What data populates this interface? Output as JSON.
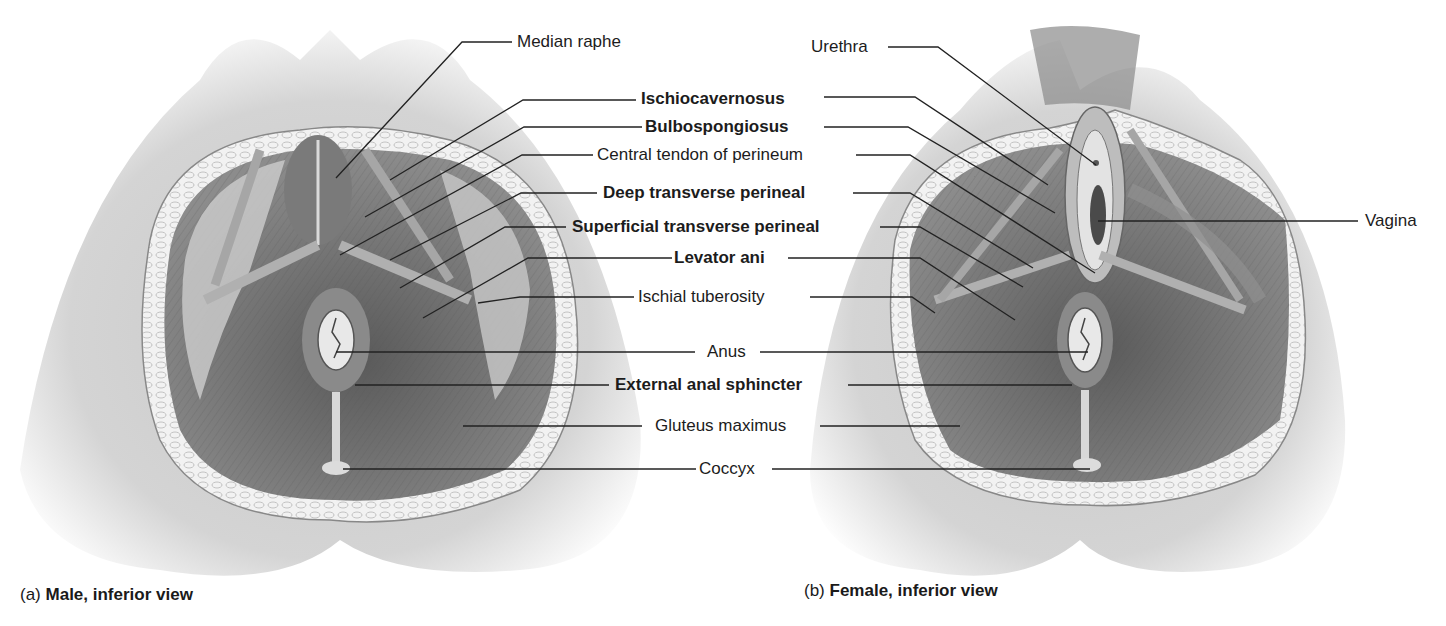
{
  "figure": {
    "panels": [
      {
        "id": "a",
        "caption_letter": "(a)",
        "caption_title": "Male, inferior view"
      },
      {
        "id": "b",
        "caption_letter": "(b)",
        "caption_title": "Female, inferior view"
      }
    ],
    "labels": {
      "median_raphe": "Median raphe",
      "urethra": "Urethra",
      "ischiocavernosus": "Ischiocavernosus",
      "bulbospongiosus": "Bulbospongiosus",
      "central_tendon": "Central tendon of perineum",
      "deep_transverse": "Deep transverse perineal",
      "superficial_transverse": "Superficial transverse perineal",
      "levator_ani": "Levator ani",
      "ischial_tuberosity": "Ischial tuberosity",
      "vagina": "Vagina",
      "anus": "Anus",
      "external_anal_sphincter": "External anal sphincter",
      "gluteus_maximus": "Gluteus maximus",
      "coccyx": "Coccyx"
    },
    "colors": {
      "skin": "#d9d9d9",
      "fat": "#efefef",
      "muscle_dark": "#6e6e6e",
      "muscle_mid": "#9a9a9a",
      "leader_line": "#222222"
    }
  }
}
